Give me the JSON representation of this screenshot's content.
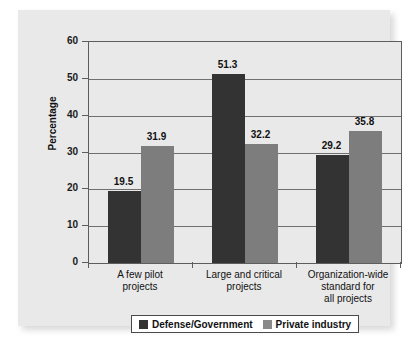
{
  "chart_data": {
    "type": "bar",
    "title": "",
    "xlabel": "",
    "ylabel": "Percentage",
    "ylim": [
      0,
      60
    ],
    "ytick_labels": [
      "60",
      "50",
      "40",
      "30",
      "20",
      "10",
      "0"
    ],
    "ytick_values": [
      60,
      50,
      40,
      30,
      20,
      10,
      0
    ],
    "grid": true,
    "legend_position": "bottom",
    "categories": [
      "A few pilot\nprojects",
      "Large and critical\nprojects",
      "Organization-wide\nstandard for\nall projects"
    ],
    "category_lines": [
      [
        "A few pilot",
        "projects"
      ],
      [
        "Large and critical",
        "projects"
      ],
      [
        "Organization-wide",
        "standard for",
        "all projects"
      ]
    ],
    "series": [
      {
        "name": "Defense/Government",
        "color": "#333333",
        "values": [
          19.5,
          51.3,
          29.2
        ],
        "labels": [
          "19.5",
          "51.3",
          "29.2"
        ]
      },
      {
        "name": "Private industry",
        "color": "#7d7d7d",
        "values": [
          31.9,
          32.2,
          35.8
        ],
        "labels": [
          "31.9",
          "32.2",
          "35.8"
        ]
      }
    ]
  },
  "legend": {
    "items": [
      {
        "label": "Defense/Government",
        "swatch": "dark"
      },
      {
        "label": "Private industry",
        "swatch": "gray"
      }
    ]
  },
  "colors": {
    "panel_background": "#e9e9e9",
    "plot_background": "#e9e9e9",
    "gridline": "#6f6f6f",
    "axis": "#5d5d5d",
    "series_dark": "#333333",
    "series_gray": "#7d7d7d",
    "text": "#111111"
  }
}
